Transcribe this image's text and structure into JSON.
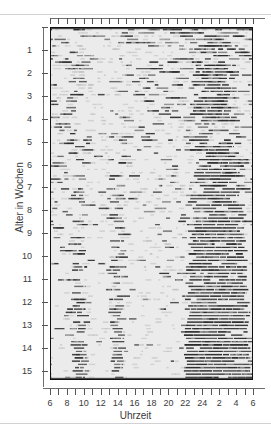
{
  "figure": {
    "kind": "actogram",
    "background_color": "#ebebeb",
    "bar_color": "#2b2b2b",
    "frame_color": "#111111"
  },
  "axes": {
    "x": {
      "title": "Uhrzeit",
      "tick_labels": [
        "6",
        "8",
        "10",
        "12",
        "14",
        "16",
        "18",
        "20",
        "22",
        "24",
        "2",
        "4",
        "6"
      ],
      "tick_hours": [
        6,
        8,
        10,
        12,
        14,
        16,
        18,
        20,
        22,
        24,
        2,
        4,
        6
      ],
      "minor_tick_count": 25,
      "range_hours": [
        6,
        30
      ]
    },
    "y": {
      "title": "Alter in Wochen",
      "tick_labels": [
        "1",
        "2",
        "3",
        "4",
        "5",
        "6",
        "7",
        "8",
        "9",
        "10",
        "11",
        "12",
        "13",
        "14",
        "15"
      ],
      "tick_values": [
        1,
        2,
        3,
        4,
        5,
        6,
        7,
        8,
        9,
        10,
        11,
        12,
        13,
        14,
        15
      ],
      "range_weeks": [
        0,
        15.4
      ]
    }
  },
  "chart_data": {
    "type": "heatmap",
    "title": "",
    "xlabel": "Uhrzeit",
    "ylabel": "Alter in Wochen",
    "xlim": [
      6,
      30
    ],
    "ylim": [
      0,
      15.4
    ],
    "xtick_labels": [
      "6",
      "8",
      "10",
      "12",
      "14",
      "16",
      "18",
      "20",
      "22",
      "24",
      "2",
      "4",
      "6"
    ],
    "ytick_labels": [
      "1",
      "2",
      "3",
      "4",
      "5",
      "6",
      "7",
      "8",
      "9",
      "10",
      "11",
      "12",
      "13",
      "14",
      "15"
    ],
    "grid": false,
    "legend": "none",
    "annotations": [
      "polyphasic scattered sleep in weeks 1-5",
      "progressive consolidation of nocturnal sleep from week 6",
      "stable night sleep block approx. 22:00-06:00 by week 15",
      "two daytime naps remain near 09:00 and 14:00 at week 15"
    ],
    "series": [
      {
        "name": "sleep episodes",
        "color": "#2b2b2b",
        "rows_per_week": 7,
        "total_rows": 108,
        "row_bouts_start_hours_end_hours": "generated per row from the consolidation model below"
      }
    ],
    "consolidation_model": {
      "night_center_start_week0": 1.5,
      "night_center_end_week15": 2.0,
      "night_duration_week0_hours": 3.0,
      "night_duration_week15_hours": 8.0,
      "nap_centers_week15": [
        9.5,
        14.0
      ],
      "nap_duration_week15_hours": 1.6,
      "scatter_bouts_week0": 11,
      "scatter_bouts_week15": 2,
      "bout_length_week0_hours": 1.1,
      "bout_length_week15_hours": 0.7
    }
  }
}
